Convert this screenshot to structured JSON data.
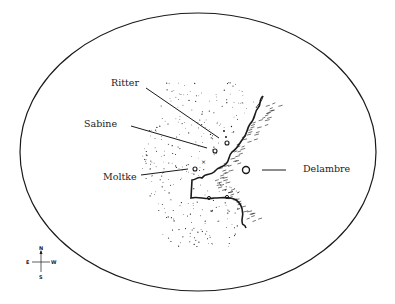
{
  "map": {
    "title": "",
    "colors": {
      "ink": "#1a1a1a",
      "background": "#ffffff"
    },
    "features": [
      {
        "id": "ritter",
        "name": "Ritter",
        "type": "crater"
      },
      {
        "id": "sabine",
        "name": "Sabine",
        "type": "crater"
      },
      {
        "id": "moltke",
        "name": "Moltke",
        "type": "crater"
      },
      {
        "id": "delambre",
        "name": "Delambre",
        "type": "crater"
      }
    ],
    "compass": {
      "north": "N",
      "south": "S",
      "east": "E",
      "west": "W"
    }
  }
}
